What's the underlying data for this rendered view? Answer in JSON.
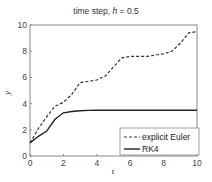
{
  "chart_data": {
    "type": "line",
    "title": "time step,  h = 0.5",
    "title_prefix": "time step,  ",
    "title_var": "h",
    "title_suffix": " = 0.5",
    "xlabel": "t",
    "ylabel": "y",
    "xlim": [
      0,
      10
    ],
    "ylim": [
      0,
      10
    ],
    "xticks": [
      0,
      2,
      4,
      6,
      8,
      10
    ],
    "yticks": [
      0,
      2,
      4,
      6,
      8,
      10
    ],
    "grid": false,
    "legend_position": "lower right",
    "x": [
      0,
      0.5,
      1,
      1.5,
      2,
      2.5,
      3,
      3.5,
      4,
      4.5,
      5,
      5.5,
      6,
      6.5,
      7,
      7.5,
      8,
      8.5,
      9,
      9.5,
      10
    ],
    "series": [
      {
        "name": "explicit Euler",
        "style": "dashed",
        "color": "#333333",
        "values": [
          1.0,
          2.1,
          3.0,
          3.8,
          4.1,
          4.7,
          5.6,
          5.7,
          5.8,
          6.1,
          6.8,
          7.5,
          7.6,
          7.6,
          7.6,
          7.7,
          7.8,
          8.0,
          8.6,
          9.4,
          9.5
        ]
      },
      {
        "name": "RK4",
        "style": "solid",
        "color": "#222222",
        "values": [
          1.0,
          1.5,
          1.9,
          2.8,
          3.3,
          3.4,
          3.45,
          3.48,
          3.5,
          3.5,
          3.5,
          3.5,
          3.5,
          3.5,
          3.5,
          3.5,
          3.5,
          3.5,
          3.5,
          3.5,
          3.5
        ]
      }
    ]
  }
}
